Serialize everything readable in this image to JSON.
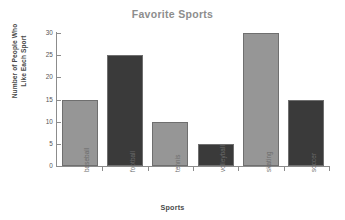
{
  "chart_data": {
    "type": "bar",
    "title": "Favorite Sports",
    "xlabel": "Sports",
    "ylabel_lines": [
      "Number of People Who",
      "Like Each Sport"
    ],
    "ylabel": "Number of People Who Like Each Sport",
    "categories": [
      "baseball",
      "football",
      "tennis",
      "volleyball",
      "skating",
      "soccer"
    ],
    "values": [
      15,
      25,
      10,
      5,
      30,
      15
    ],
    "yticks": [
      0,
      5,
      10,
      15,
      20,
      25,
      30
    ],
    "ylim": [
      0,
      30
    ],
    "grid": false,
    "legend": "none",
    "bar_colors": [
      "#969696",
      "#3a3a3a",
      "#969696",
      "#3a3a3a",
      "#969696",
      "#3a3a3a"
    ],
    "bar_edge_color": "#6f6f6f"
  },
  "colors": {
    "background": "#ffffff",
    "title": "#8d8d8d",
    "axis_line": "#8c8c8c",
    "tick_label": "#545454",
    "category_label": "#6b6b6b",
    "axis_title": "#4a4a4a",
    "bar_light": "#969696",
    "bar_dark": "#3a3a3a"
  }
}
